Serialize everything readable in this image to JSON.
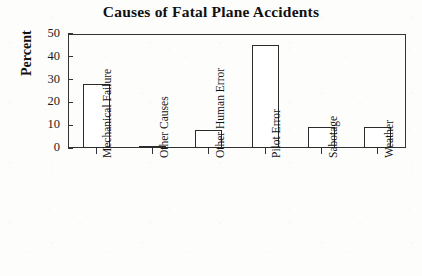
{
  "chart_data": {
    "type": "bar",
    "title": "Causes of Fatal Plane Accidents",
    "xlabel": "",
    "ylabel": "Percent",
    "categories": [
      "Mechanical Failure",
      "Other Causes",
      "Other Human Error",
      "Pilot Error",
      "Sabotage",
      "Weather"
    ],
    "values": [
      28,
      1,
      8,
      45,
      9,
      9
    ],
    "ylim": [
      0,
      50
    ],
    "yticks": [
      0,
      10,
      20,
      30,
      40,
      50
    ],
    "ytick_labels": [
      "0",
      "10",
      "20",
      "30",
      "40",
      "50"
    ],
    "grid": false,
    "legend": null,
    "bar_fill_color": "#ffffff",
    "bar_edge_color": "#2b2b2b",
    "axis_color": "#333333",
    "background_color": "#fdfdfc"
  }
}
